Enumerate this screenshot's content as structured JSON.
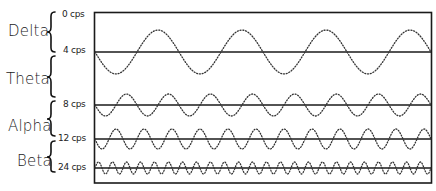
{
  "figure": {
    "type": "brainwave-frequency-diagram",
    "bands": [
      {
        "name": "Delta",
        "range_label": "0–4 cps"
      },
      {
        "name": "Theta",
        "range_label": "4–8 cps"
      },
      {
        "name": "Alpha",
        "range_label": "8–12 cps"
      },
      {
        "name": "Beta",
        "range_label": "12–24 cps"
      }
    ],
    "frequency_labels": [
      "0 cps",
      "4 cps",
      "8 cps",
      "12 cps",
      "24 cps"
    ],
    "waves": [
      {
        "frequency_label": "4 cps",
        "cycles": 4,
        "baseline_y": 52,
        "amplitude": 22,
        "start_phase": "down"
      },
      {
        "frequency_label": "8 cps",
        "cycles": 8,
        "baseline_y": 105,
        "amplitude": 11,
        "start_phase": "down"
      },
      {
        "frequency_label": "12 cps",
        "cycles": 12,
        "baseline_y": 139,
        "amplitude": 10,
        "start_phase": "down"
      },
      {
        "frequency_label": "24 cps",
        "cycles": 24,
        "baseline_y": 168,
        "amplitude": 6,
        "start_phase": "up"
      }
    ],
    "colors": {
      "line": "#1a1a1a",
      "wave": "#333333",
      "background": "#ffffff"
    }
  }
}
